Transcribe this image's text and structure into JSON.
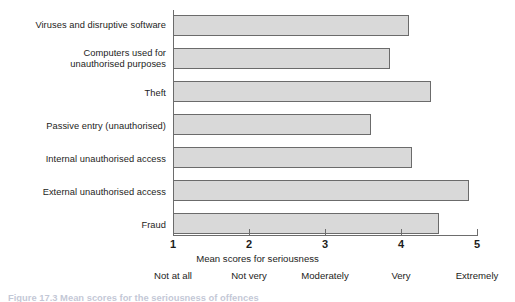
{
  "chart_data": {
    "type": "bar",
    "orientation": "horizontal",
    "title": "",
    "xlabel": "Mean scores for seriousness",
    "ylabel": "",
    "xlim": [
      1,
      5
    ],
    "grid": false,
    "legend": null,
    "categories": [
      "Viruses and disruptive software",
      "Computers used for\nunauthorised purposes",
      "Theft",
      "Passive entry (unauthorised)",
      "Internal unauthorised access",
      "External unauthorised access",
      "Fraud"
    ],
    "values": [
      4.1,
      3.85,
      4.4,
      3.6,
      4.15,
      4.9,
      4.5
    ],
    "tick_labels": [
      "1",
      "2",
      "3",
      "4",
      "5"
    ],
    "tick_values": [
      1,
      2,
      3,
      4,
      5
    ],
    "scale_anchors": [
      "Not at all",
      "Not very",
      "Moderately",
      "Very",
      "Extremely"
    ],
    "bar_fill": "#d9d9d9",
    "bar_border": "#6b6b6b",
    "axis_color": "#6d6d6d"
  },
  "axis": {
    "title": "Mean scores for seriousness"
  },
  "caption": {
    "text": "Figure 17.3  Mean scores for the seriousness of offences"
  }
}
